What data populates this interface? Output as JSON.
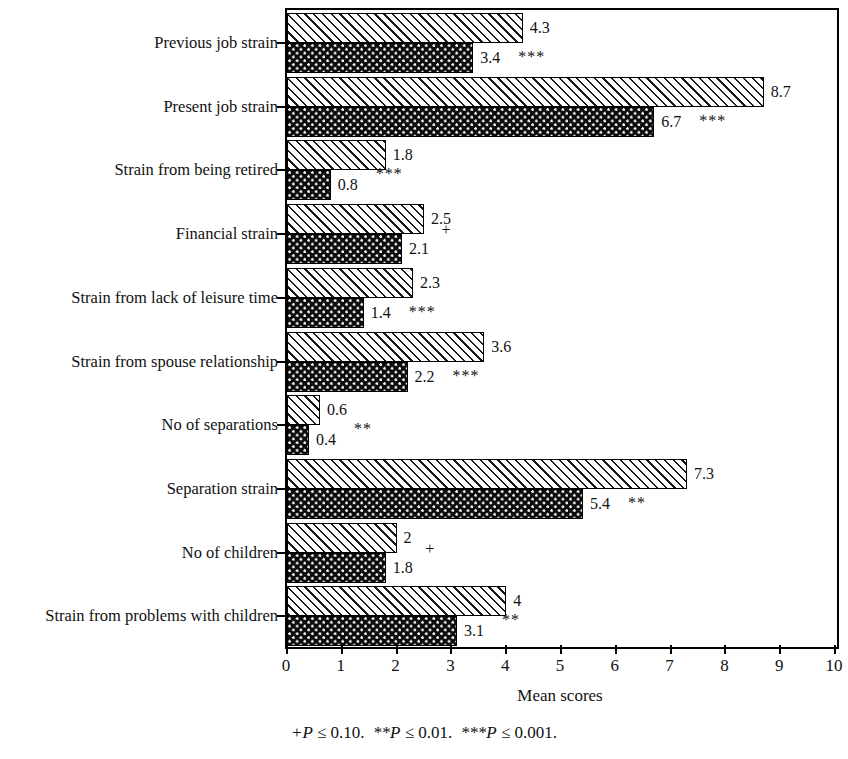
{
  "chart_data": {
    "type": "bar",
    "orientation": "horizontal",
    "title": "",
    "xlabel": "Mean scores",
    "ylabel": "",
    "xlim": [
      0,
      10
    ],
    "xticks": [
      "0",
      "1",
      "2",
      "3",
      "4",
      "5",
      "6",
      "7",
      "8",
      "9",
      "10"
    ],
    "grid": false,
    "legend_position": "none",
    "categories": [
      "Previous job strain",
      "Present job strain",
      "Strain from being retired",
      "Financial strain",
      "Strain from lack of leisure time",
      "Strain from spouse relationship",
      "No of separations",
      "Separation strain",
      "No of children",
      "Strain from problems with children"
    ],
    "series": [
      {
        "name": "series-1-hatched",
        "pattern": "diagonal-hatch",
        "values": [
          4.3,
          8.7,
          1.8,
          2.5,
          2.3,
          3.6,
          0.6,
          7.3,
          2,
          4
        ],
        "value_labels": [
          "4.3",
          "8.7",
          "1.8",
          "2.5",
          "2.3",
          "3.6",
          "0.6",
          "7.3",
          "2",
          "4"
        ]
      },
      {
        "name": "series-2-dotted",
        "pattern": "dotted-dark",
        "values": [
          3.4,
          6.7,
          0.8,
          2.1,
          1.4,
          2.2,
          0.4,
          5.4,
          1.8,
          3.1
        ],
        "value_labels": [
          "3.4",
          "6.7",
          "0.8",
          "2.1",
          "1.4",
          "2.2",
          "0.4",
          "5.4",
          "1.8",
          "3.1"
        ]
      }
    ],
    "significance_markers": [
      "***",
      "***",
      "***",
      "+",
      "***",
      "***",
      "**",
      "**",
      "+",
      "**"
    ],
    "annotations": {
      "footnote_part1": "+P",
      "footnote_op1": " ≤ ",
      "footnote_val1": "0.10.",
      "footnote_part2": "**P",
      "footnote_op2": " ≤ ",
      "footnote_val2": "0.01.",
      "footnote_part3": "***P",
      "footnote_op3": " ≤ ",
      "footnote_val3": "0.001."
    },
    "colors": {
      "axis": "#000000",
      "series1_fill": "#f2f2f2",
      "series1_hatch": "#1a1a1a",
      "series2_fill": "#0d0d0d",
      "series2_dots": "#f2f2f2",
      "text": "#111111",
      "background": "#ffffff"
    }
  }
}
